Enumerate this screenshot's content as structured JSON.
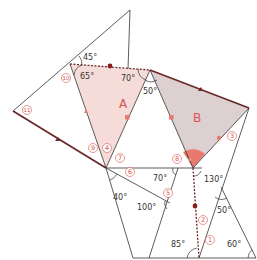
{
  "colors": {
    "line": "#333333",
    "accent": "#d9534f",
    "marker": "#8b1a1a",
    "regionA": "#f6dcd8",
    "regionB": "#dcd0d0",
    "bAngleFill": "#e8796e"
  },
  "regions": [
    {
      "id": "A",
      "label": "A"
    },
    {
      "id": "B",
      "label": "B"
    }
  ],
  "angles": {
    "a45": "45°",
    "a65": "65°",
    "a70top": "70°",
    "a50top": "50°",
    "aB": "?°",
    "a130": "130°",
    "a40": "40°",
    "a70mid": "70°",
    "a100": "100°",
    "a50low": "50°",
    "a85": "85°",
    "a60": "60°"
  },
  "circled_numbers": {
    "n1": "1",
    "n2": "2",
    "n3": "3",
    "n4": "4",
    "n5": "5",
    "n6": "6",
    "n7": "7",
    "n8": "8",
    "n9": "9",
    "n10": "10",
    "n11": "11"
  }
}
